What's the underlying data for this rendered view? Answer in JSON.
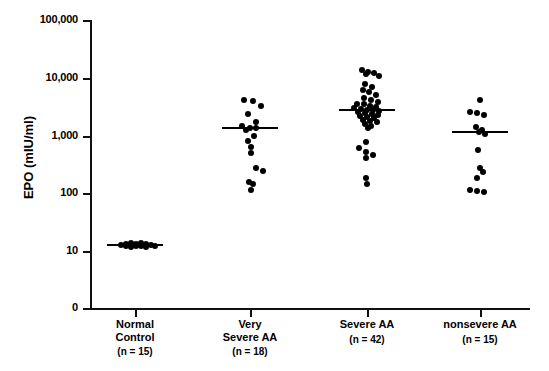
{
  "chart_data": {
    "type": "scatter",
    "title": "",
    "xlabel": "",
    "ylabel": "EPO (mIU/ml)",
    "yscale": "log",
    "ylim": [
      10,
      100000
    ],
    "y_ticks": [
      {
        "label": "100,000",
        "value": 100000,
        "y": 20
      },
      {
        "label": "10,000",
        "value": 10000,
        "y": 78
      },
      {
        "label": "1,000",
        "value": 1000,
        "y": 136
      },
      {
        "label": "100",
        "value": 100,
        "y": 193
      },
      {
        "label": "10",
        "value": 10,
        "y": 251
      },
      {
        "label": "0",
        "value": 0,
        "y": 308
      }
    ],
    "grid": false,
    "legend": "none",
    "groups": [
      {
        "name": "Normal Control",
        "label_line1": "Normal",
        "label_line2": "Control",
        "n_label": "(n = 15)",
        "n": 15,
        "center_x": 135,
        "median": 12,
        "median_y": 245,
        "points_y": [
          245,
          244,
          246,
          243,
          245,
          247,
          244,
          246,
          245,
          243,
          246,
          244,
          247,
          245,
          246
        ],
        "points_dx": [
          -14,
          -9,
          -9,
          -4,
          -4,
          -4,
          1,
          1,
          1,
          6,
          6,
          11,
          11,
          16,
          20
        ]
      },
      {
        "name": "Very Severe AA",
        "label_line1": "Very",
        "label_line2": "Severe AA",
        "n_label": "(n = 18)",
        "n": 18,
        "center_x": 250,
        "median": 1200,
        "median_y": 128,
        "points_y": [
          100,
          101,
          106,
          114,
          122,
          126,
          128,
          128,
          130,
          136,
          141,
          147,
          153,
          168,
          171,
          182,
          184,
          190
        ],
        "points_dx": [
          -6,
          3,
          11,
          -2,
          6,
          -8,
          0,
          6,
          -4,
          4,
          -2,
          1,
          1,
          6,
          13,
          -1,
          3,
          1
        ]
      },
      {
        "name": "Severe AA",
        "label_line1": "Severe AA",
        "label_line2": "",
        "n_label": "(n = 42)",
        "n": 42,
        "center_x": 367,
        "median": 2900,
        "median_y": 110,
        "points_y": [
          70,
          72,
          73,
          74,
          76,
          84,
          87,
          90,
          92,
          95,
          98,
          100,
          102,
          104,
          104,
          106,
          107,
          108,
          109,
          110,
          110,
          111,
          112,
          113,
          114,
          115,
          116,
          117,
          118,
          120,
          121,
          122,
          124,
          126,
          128,
          142,
          148,
          152,
          155,
          158,
          178,
          184
        ],
        "points_dx": [
          -5,
          1,
          7,
          -1,
          12,
          -2,
          5,
          -4,
          2,
          9,
          -3,
          4,
          11,
          -10,
          -3,
          3,
          9,
          -13,
          -6,
          0,
          6,
          12,
          -9,
          -2,
          5,
          11,
          -7,
          0,
          7,
          -4,
          3,
          10,
          -2,
          4,
          1,
          -1,
          -8,
          -1,
          6,
          -1,
          -1,
          0
        ]
      },
      {
        "name": "nonsevere AA",
        "label_line1": "nonsevere AA",
        "label_line2": "",
        "n_label": "(n = 15)",
        "n": 15,
        "center_x": 480,
        "median": 1300,
        "median_y": 132,
        "points_y": [
          100,
          112,
          113,
          115,
          127,
          130,
          132,
          134,
          150,
          168,
          172,
          178,
          190,
          191,
          192
        ],
        "points_dx": [
          0,
          -10,
          -3,
          4,
          -4,
          2,
          -1,
          5,
          -2,
          0,
          3,
          -3,
          -10,
          -3,
          4
        ]
      }
    ]
  }
}
